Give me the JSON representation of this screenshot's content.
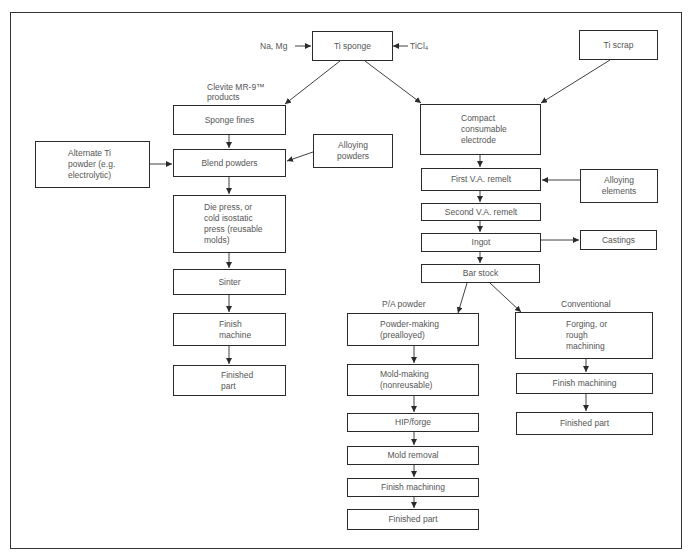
{
  "diagram": {
    "inputs": {
      "na_mg": "Na, Mg",
      "ticl4": "TiCl₄"
    },
    "labels": {
      "clevite": "Clevite MR-9™\nproducts",
      "pa_powder": "P/A powder",
      "conventional": "Conventional"
    },
    "nodes": {
      "ti_sponge": "Ti sponge",
      "ti_scrap": "Ti scrap",
      "sponge_fines": "Sponge fines",
      "alternate_ti": "Alternate Ti\npowder (e.g.\nelectrolytic)",
      "blend_powders": "Blend powders",
      "alloying_powders": "Alloying\npowders",
      "die_press": "Die press, or\ncold isostatic\npress (reusable\nmolds)",
      "sinter": "Sinter",
      "finish_machine": "Finish\nmachine",
      "finished_part_left": "Finished\npart",
      "compact_electrode": "Compact\nconsumable\nelectrode",
      "first_va": "First V.A. remelt",
      "alloying_elements": "Alloying\nelements",
      "second_va": "Second V.A. remelt",
      "ingot": "Ingot",
      "castings": "Castings",
      "bar_stock": "Bar stock",
      "powder_making": "Powder-making\n(prealloyed)",
      "mold_making": "Mold-making\n(nonreusable)",
      "hip_forge": "HIP/forge",
      "mold_removal": "Mold removal",
      "finish_machining_pa": "Finish machining",
      "finished_part_pa": "Finished part",
      "forging": "Forging, or\nrough\nmachining",
      "finish_machining_conv": "Finish machining",
      "finished_part_conv": "Finished part"
    },
    "colors": {
      "line": "#2a2a2a",
      "text": "#555555",
      "background": "#ffffff"
    }
  }
}
